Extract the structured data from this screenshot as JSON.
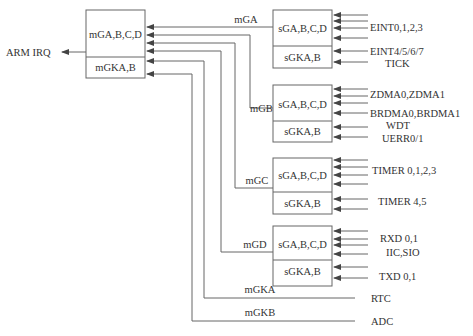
{
  "diagram": {
    "output": {
      "label": "ARM IRQ"
    },
    "main_controller": {
      "top_label": "mGA,B,C,D",
      "bottom_label": "mGKA,B"
    },
    "groups": [
      {
        "id": "A",
        "line_label": "mGA",
        "top_label": "sGA,B,C,D",
        "bottom_label": "sGKA,B",
        "sources": [
          "EINT0,1,2,3",
          "EINT4/5/6/7",
          "TICK"
        ]
      },
      {
        "id": "B",
        "line_label": "mGB",
        "top_label": "sGA,B,C,D",
        "bottom_label": "sGKA,B",
        "sources": [
          "ZDMA0,ZDMA1",
          "BRDMA0,BRDMA1",
          "WDT",
          "UERR0/1"
        ]
      },
      {
        "id": "C",
        "line_label": "mGC",
        "top_label": "sGA,B,C,D",
        "bottom_label": "sGKA,B",
        "sources": [
          "TIMER 0,1,2,3",
          "TIMER 4,5"
        ]
      },
      {
        "id": "D",
        "line_label": "mGD",
        "top_label": "sGA,B,C,D",
        "bottom_label": "sGKA,B",
        "sources": [
          "RXD 0,1",
          "IIC,SIO",
          "TXD 0,1"
        ]
      }
    ],
    "direct_inputs": [
      {
        "line_label": "mGKA",
        "source": "RTC"
      },
      {
        "line_label": "mGKB",
        "source": "ADC"
      }
    ],
    "colors": {
      "line": "#666666",
      "text": "#333333",
      "background": "#ffffff"
    }
  }
}
